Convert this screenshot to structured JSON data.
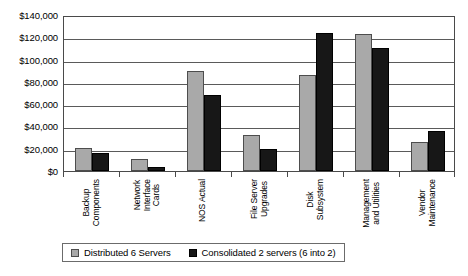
{
  "chart_data": {
    "type": "bar",
    "title": "",
    "subtitle": "",
    "xlabel": "",
    "ylabel": "",
    "grid": true,
    "legend_position": "bottom",
    "ylim": [
      0,
      140000
    ],
    "ytick_values": [
      140000,
      120000,
      100000,
      80000,
      60000,
      40000,
      20000,
      0
    ],
    "ytick_labels": [
      "$140,000",
      "$120,000",
      "$100,000",
      "$80,000",
      "$60,000",
      "$40,000",
      "$20,000",
      "$0"
    ],
    "categories": [
      "Backup Components",
      "Network Interface Cards",
      "NOS Actual",
      "File Server Upgrades",
      "Disk Subsystem",
      "Management and Utilities",
      "Vendor Maintenance"
    ],
    "category_label_lines": [
      [
        "Backup",
        "Components"
      ],
      [
        "Network",
        "Interface",
        "Cards"
      ],
      [
        "NOS Actual"
      ],
      [
        "File Server",
        "Upgrades"
      ],
      [
        "Disk",
        "Subsystem"
      ],
      [
        "Management",
        "and Utilities"
      ],
      [
        "Vendor",
        "Maintenance"
      ]
    ],
    "series": [
      {
        "name": "Distributed 6 Servers",
        "color": "#a9a9a9",
        "values": [
          21000,
          11000,
          90000,
          32000,
          86000,
          123000,
          26000
        ]
      },
      {
        "name": "Consolidated 2 servers (6 into 2)",
        "color": "#171717",
        "values": [
          16000,
          4000,
          68000,
          20000,
          124000,
          110000,
          36000
        ]
      }
    ]
  },
  "legend": {
    "items": [
      {
        "label": "Distributed 6 Servers",
        "swatch": "light-gray-swatch"
      },
      {
        "label": "Consolidated 2 servers (6 into 2)",
        "swatch": "black-swatch"
      }
    ]
  },
  "colors": {
    "series_distributed": "#a9a9a9",
    "series_consolidated": "#171717",
    "axis": "#4a4a4a",
    "gridline": "#5a5a5a",
    "background": "#ffffff"
  }
}
